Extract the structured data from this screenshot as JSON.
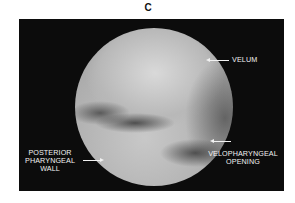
{
  "figure": {
    "panel_label": "C",
    "annotations": {
      "velum": "VELUM",
      "velopharyngeal_line1": "VELOPHARYNGEAL",
      "velopharyngeal_line2": "OPENING",
      "posterior_line1": "POSTERIOR",
      "posterior_line2": "PHARYNGEAL",
      "posterior_line3": "WALL"
    },
    "image_description": "Circular endoscopic view of the velopharyngeal port on black background"
  }
}
